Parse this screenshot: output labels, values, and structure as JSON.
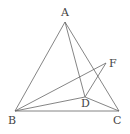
{
  "diagram": {
    "points": {
      "A": {
        "label": "A",
        "x": 65,
        "y": 22,
        "lx": 61,
        "ly": 16
      },
      "B": {
        "label": "B",
        "x": 15,
        "y": 111,
        "lx": 8,
        "ly": 124
      },
      "C": {
        "label": "C",
        "x": 119,
        "y": 111,
        "lx": 113,
        "ly": 124
      },
      "D": {
        "label": "D",
        "x": 85,
        "y": 97,
        "lx": 81,
        "ly": 107
      },
      "F": {
        "label": "F",
        "x": 106,
        "y": 63,
        "lx": 109,
        "ly": 67
      }
    },
    "segments": [
      [
        "A",
        "B"
      ],
      [
        "A",
        "C"
      ],
      [
        "B",
        "C"
      ],
      [
        "A",
        "D"
      ],
      [
        "B",
        "D"
      ],
      [
        "D",
        "C"
      ],
      [
        "B",
        "F"
      ],
      [
        "D",
        "F"
      ]
    ]
  }
}
